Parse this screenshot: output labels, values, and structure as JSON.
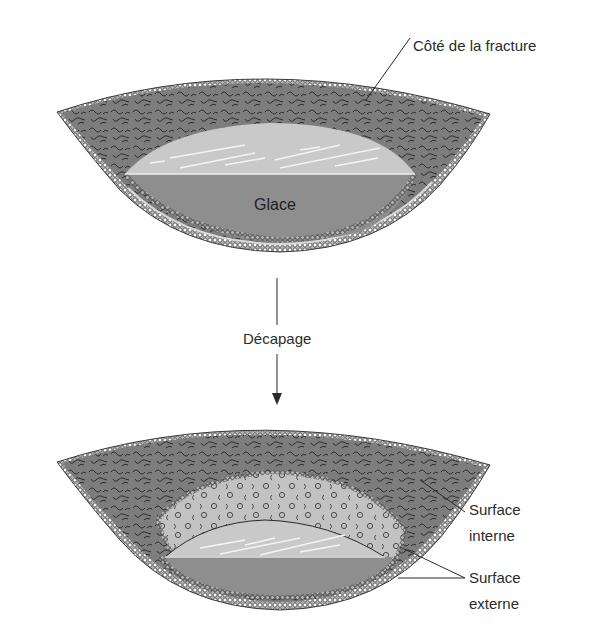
{
  "diagram": {
    "title": "",
    "panels": [
      {
        "id": "before",
        "description": "Fractured membrane vesicle over ice block",
        "labels": {
          "fracture_side": "Côté de la fracture",
          "ice": "Glace"
        }
      },
      {
        "id": "after",
        "description": "Same vesicle after etching, exposing membrane surfaces",
        "labels": {
          "inner_surface_line1": "Surface",
          "inner_surface_line2": "interne",
          "outer_surface_line1": "Surface",
          "outer_surface_line2": "externe"
        }
      }
    ],
    "process_arrow": {
      "label": "Décapage",
      "direction": "down"
    },
    "colors": {
      "background": "#ffffff",
      "fracture_texture": "#7a7a7a",
      "texture_strokes": "#2e2e2e",
      "ice_top": "#c8c8c8",
      "ice_front": "#8e8e8e",
      "etched_surface": "#bdbdbd",
      "lipid_heads": "#9a9a9a",
      "lines": "#1e1e1e"
    }
  }
}
